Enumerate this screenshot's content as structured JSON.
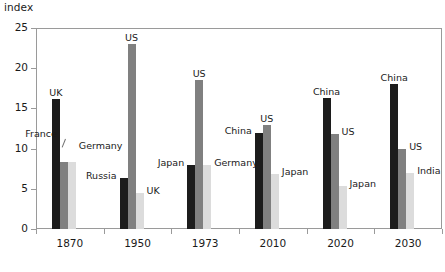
{
  "chart_data": {
    "type": "bar",
    "title": "",
    "subtitle": "",
    "xlabel": "",
    "ylabel": "index",
    "ylim": [
      0,
      25
    ],
    "yticks": [
      0,
      5,
      10,
      15,
      20,
      25
    ],
    "grid": false,
    "legend_position": "none",
    "note": "Grouped bar chart; each group has up to three bars shaded dark, medium and light grey, each annotated directly with its country name.",
    "categories": [
      "1870",
      "1950",
      "1973",
      "2010",
      "2020",
      "2030"
    ],
    "series": [
      {
        "name": "first",
        "shade": "dark",
        "color": "#1c1c1c",
        "labels": [
          "UK",
          "Russia",
          "Japan",
          "China",
          "China",
          "China"
        ],
        "values": [
          16.2,
          6.4,
          7.9,
          12.0,
          16.3,
          18.0
        ]
      },
      {
        "name": "second",
        "shade": "medium",
        "color": "#808080",
        "labels": [
          "France",
          "US",
          "US",
          "US",
          "US",
          "US"
        ],
        "values": [
          8.3,
          23.0,
          18.5,
          12.9,
          11.8,
          10.0
        ]
      },
      {
        "name": "third",
        "shade": "light",
        "color": "#dcdcdc",
        "labels": [
          "Germany",
          "UK",
          "Germany",
          "Japan",
          "Japan",
          "India"
        ],
        "values": [
          8.3,
          4.5,
          7.9,
          6.9,
          5.4,
          7.0
        ]
      }
    ],
    "annotations": [
      {
        "text": "UK",
        "group": "1870",
        "series": "first"
      },
      {
        "text": "France",
        "group": "1870",
        "series": "second"
      },
      {
        "text": "Germany",
        "group": "1870",
        "series": "third"
      },
      {
        "text": "Russia",
        "group": "1950",
        "series": "first"
      },
      {
        "text": "US",
        "group": "1950",
        "series": "second"
      },
      {
        "text": "UK",
        "group": "1950",
        "series": "third"
      },
      {
        "text": "Japan",
        "group": "1973",
        "series": "first"
      },
      {
        "text": "US",
        "group": "1973",
        "series": "second"
      },
      {
        "text": "Germany",
        "group": "1973",
        "series": "third"
      },
      {
        "text": "China",
        "group": "2010",
        "series": "first"
      },
      {
        "text": "US",
        "group": "2010",
        "series": "second"
      },
      {
        "text": "Japan",
        "group": "2010",
        "series": "third"
      },
      {
        "text": "China",
        "group": "2020",
        "series": "first"
      },
      {
        "text": "US",
        "group": "2020",
        "series": "second"
      },
      {
        "text": "Japan",
        "group": "2020",
        "series": "third"
      },
      {
        "text": "China",
        "group": "2030",
        "series": "first"
      },
      {
        "text": "US",
        "group": "2030",
        "series": "second"
      },
      {
        "text": "India",
        "group": "2030",
        "series": "third"
      }
    ],
    "colors": {
      "dark": "#1c1c1c",
      "medium": "#808080",
      "light": "#dcdcdc",
      "axis": "#9a9a9a",
      "text": "#1a1a1a",
      "background": "#ffffff"
    }
  },
  "ytick_labels": [
    "0",
    "5",
    "10",
    "15",
    "20",
    "25"
  ],
  "xtick_labels": [
    "1870",
    "1950",
    "1973",
    "2010",
    "2020",
    "2030"
  ]
}
